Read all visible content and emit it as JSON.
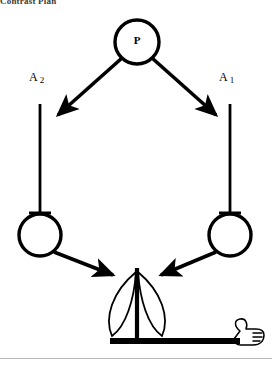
{
  "figure": {
    "caption": "Contrast Plan",
    "type": "node-link-diagram",
    "background_color": "#ffffff",
    "stroke_color": "#000000",
    "canvas": {
      "width": 272,
      "height": 371
    }
  },
  "nodes": {
    "parent": {
      "id": "P",
      "label": "P",
      "shape": "circle",
      "cx": 137,
      "cy": 42,
      "r": 22
    },
    "left_leaf": {
      "id": "left-circle",
      "label": "",
      "shape": "circle",
      "cx": 40,
      "cy": 235,
      "r": 21
    },
    "right_leaf": {
      "id": "right-circle",
      "label": "",
      "shape": "circle",
      "cx": 230,
      "cy": 235,
      "r": 21
    }
  },
  "axis_labels": {
    "left": {
      "base": "A",
      "subscript": "2"
    },
    "right": {
      "base": "A",
      "subscript": "1"
    }
  },
  "edges": [
    {
      "name": "p-to-a2",
      "from": "P",
      "to": "A2",
      "style": "arrow",
      "direction": "down-left"
    },
    {
      "name": "p-to-a1",
      "from": "P",
      "to": "A1",
      "style": "arrow",
      "direction": "down-right"
    },
    {
      "name": "a2-axis",
      "from": "A2",
      "to": "left-circle",
      "style": "line-with-tee",
      "direction": "down"
    },
    {
      "name": "a1-axis",
      "from": "A1",
      "to": "right-circle",
      "style": "line-with-tee",
      "direction": "down"
    },
    {
      "name": "left-to-plant",
      "from": "left-circle",
      "to": "plant",
      "style": "arrow",
      "direction": "down-right"
    },
    {
      "name": "right-to-plant",
      "from": "right-circle",
      "to": "plant",
      "style": "arrow",
      "direction": "down-left"
    }
  ],
  "plant": {
    "name": "plant-glyph",
    "stem_x": 137,
    "stem_top": 268,
    "stem_bottom": 340,
    "leaf_count": 2,
    "ground": {
      "x1": 110,
      "x2": 240,
      "y": 341,
      "thickness": 6
    }
  },
  "hand": {
    "name": "hand-icon",
    "description": "pointing hand at right end of ground line",
    "x": 232,
    "y": 326
  },
  "rule": {
    "y": 358,
    "color": "#b9b9b9"
  }
}
